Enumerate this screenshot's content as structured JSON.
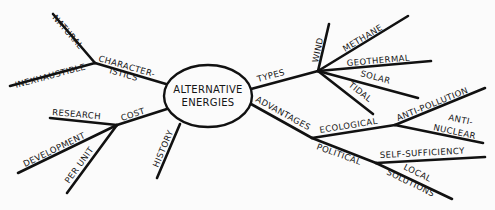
{
  "diagram": {
    "type": "mind-map",
    "center": {
      "line1": "ALTERNATIVE",
      "line2": "ENERGIES"
    },
    "branches": {
      "characteristics": {
        "label1": "CHARACTER-",
        "label2": "ISTICS",
        "children": {
          "natural": "NATURAL",
          "inexhaustible": "INEXHAUSTIBLE"
        }
      },
      "cost": {
        "label": "COST",
        "children": {
          "research": "RESEARCH",
          "development": "DEVELOPMENT",
          "per_unit": "PER UNIT"
        }
      },
      "history": {
        "label": "HISTORY"
      },
      "types": {
        "label": "TYPES",
        "children": {
          "wind": "WIND",
          "methane": "METHANE",
          "geothermal": "GEOTHERMAL",
          "solar": "SOLAR",
          "tidal": "TIDAL"
        }
      },
      "advantages": {
        "label": "ADVANTAGES",
        "children": {
          "ecological": {
            "label": "ECOLOGICAL",
            "children": {
              "anti_pollution": "ANTI-POLLUTION",
              "anti_nuclear1": "ANTI-",
              "anti_nuclear2": "NUCLEAR"
            }
          },
          "political": {
            "label": "POLITICAL",
            "children": {
              "self_sufficiency": "SELF-SUFFICIENCY",
              "local1": "LOCAL",
              "local2": "SOLUTIONS"
            }
          }
        }
      }
    }
  }
}
